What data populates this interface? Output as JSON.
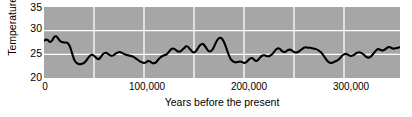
{
  "chart_data": {
    "type": "line",
    "title": "",
    "xlabel": "Years before the present",
    "ylabel": "Temperature °C",
    "xlim": [
      0,
      356000
    ],
    "ylim": [
      20,
      35
    ],
    "grid": true,
    "legend": null,
    "x_ticks": [
      "0",
      "100,000",
      "200,000",
      "300,000"
    ],
    "x_tick_values": [
      0,
      100000,
      200000,
      300000
    ],
    "y_ticks": [
      "20",
      "25",
      "30",
      "35"
    ],
    "y_tick_values": [
      20,
      25,
      30,
      35
    ],
    "gridline_x_values": [
      50000,
      100000,
      150000,
      200000,
      250000,
      300000
    ],
    "gridline_y_values": [
      25,
      30
    ],
    "series_name": "Sea surface temperature",
    "line_color": "#000000",
    "plot_background": "#a6a6a6",
    "grid_color": "#ffffff",
    "x": [
      0,
      2000,
      4000,
      6000,
      8000,
      10000,
      12000,
      14000,
      16000,
      18000,
      20000,
      22000,
      24000,
      26000,
      28000,
      30000,
      32000,
      34000,
      36000,
      38000,
      40000,
      42000,
      44000,
      46000,
      48000,
      50000,
      52000,
      54000,
      56000,
      58000,
      60000,
      62000,
      64000,
      66000,
      68000,
      70000,
      72000,
      74000,
      76000,
      78000,
      80000,
      82000,
      84000,
      86000,
      88000,
      90000,
      92000,
      94000,
      96000,
      98000,
      100000,
      102000,
      104000,
      106000,
      108000,
      110000,
      112000,
      114000,
      116000,
      118000,
      120000,
      122000,
      124000,
      126000,
      128000,
      130000,
      132000,
      134000,
      136000,
      138000,
      140000,
      142000,
      144000,
      146000,
      148000,
      150000,
      152000,
      154000,
      156000,
      158000,
      160000,
      162000,
      164000,
      166000,
      168000,
      170000,
      172000,
      174000,
      176000,
      178000,
      180000,
      182000,
      184000,
      186000,
      188000,
      190000,
      192000,
      194000,
      196000,
      198000,
      200000,
      202000,
      204000,
      206000,
      208000,
      210000,
      212000,
      214000,
      216000,
      218000,
      220000,
      222000,
      224000,
      226000,
      228000,
      230000,
      232000,
      234000,
      236000,
      238000,
      240000,
      242000,
      244000,
      246000,
      248000,
      250000,
      252000,
      254000,
      256000,
      258000,
      260000,
      262000,
      264000,
      266000,
      268000,
      270000,
      272000,
      274000,
      276000,
      278000,
      280000,
      282000,
      284000,
      286000,
      288000,
      290000,
      292000,
      294000,
      296000,
      298000,
      300000,
      302000,
      304000,
      306000,
      308000,
      310000,
      312000,
      314000,
      316000,
      318000,
      320000,
      322000,
      324000,
      326000,
      328000,
      330000,
      332000,
      334000,
      336000,
      338000,
      340000,
      342000,
      344000,
      346000,
      348000,
      350000,
      352000,
      354000,
      356000
    ],
    "y": [
      27.9,
      28.1,
      28.0,
      27.6,
      27.9,
      28.6,
      28.8,
      28.4,
      27.8,
      27.6,
      27.5,
      27.5,
      27.3,
      26.6,
      25.3,
      24.0,
      23.3,
      23.0,
      22.9,
      23.0,
      23.2,
      23.6,
      24.2,
      24.7,
      24.9,
      24.7,
      24.3,
      24.0,
      24.2,
      24.8,
      25.2,
      25.3,
      25.1,
      24.8,
      24.7,
      24.9,
      25.2,
      25.4,
      25.5,
      25.3,
      25.1,
      24.9,
      24.8,
      24.7,
      24.6,
      24.4,
      24.1,
      23.8,
      23.5,
      23.3,
      23.2,
      23.3,
      23.6,
      23.5,
      23.2,
      23.1,
      23.3,
      23.8,
      24.3,
      24.6,
      24.8,
      24.9,
      25.3,
      25.8,
      26.2,
      26.2,
      25.9,
      25.6,
      25.6,
      25.9,
      26.3,
      26.7,
      26.6,
      26.1,
      25.6,
      25.4,
      25.7,
      26.3,
      26.9,
      27.2,
      27.0,
      26.4,
      25.8,
      25.6,
      25.9,
      26.6,
      27.5,
      28.2,
      28.5,
      28.3,
      27.6,
      26.5,
      25.3,
      24.3,
      23.7,
      23.4,
      23.3,
      23.4,
      23.5,
      23.4,
      23.2,
      23.3,
      23.7,
      24.1,
      24.2,
      23.9,
      23.6,
      23.8,
      24.3,
      24.7,
      24.8,
      24.7,
      24.6,
      24.7,
      25.0,
      25.5,
      26.0,
      26.3,
      26.1,
      25.7,
      25.5,
      25.6,
      25.9,
      26.0,
      25.8,
      25.5,
      25.4,
      25.5,
      25.8,
      26.1,
      26.4,
      26.5,
      26.4,
      26.4,
      26.3,
      26.2,
      26.1,
      25.9,
      25.6,
      25.2,
      24.6,
      24.0,
      23.5,
      23.2,
      23.2,
      23.4,
      23.6,
      23.8,
      24.2,
      24.7,
      25.0,
      25.1,
      24.9,
      24.7,
      24.7,
      24.9,
      25.2,
      25.4,
      25.4,
      25.2,
      24.9,
      24.5,
      24.3,
      24.4,
      24.8,
      25.3,
      25.8,
      26.1,
      26.0,
      25.8,
      25.9,
      26.2,
      26.5,
      26.5,
      26.3,
      26.2,
      26.3,
      26.4,
      26.5
    ]
  }
}
